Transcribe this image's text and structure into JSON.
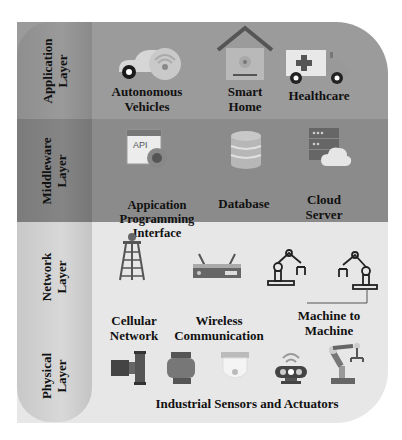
{
  "layers": [
    {
      "label": "Application\nLayer",
      "items": [
        {
          "label": "Autonomous\nVehicles",
          "icon": "autonomous-car-icon"
        },
        {
          "label": "Smart\nHome",
          "icon": "smart-home-icon"
        },
        {
          "label": "Healthcare",
          "icon": "ambulance-icon"
        }
      ]
    },
    {
      "label": "Middleware\nLayer",
      "items": [
        {
          "label": "Appication\nProgramming\nInterface",
          "icon": "api-gear-icon",
          "badge": "API"
        },
        {
          "label": "Database",
          "icon": "database-icon"
        },
        {
          "label": "Cloud\nServer",
          "icon": "cloud-server-icon"
        }
      ]
    },
    {
      "label": "Network\nLayer",
      "items": [
        {
          "label": "Cellular\nNetwork",
          "icon": "cell-tower-icon"
        },
        {
          "label": "Wireless\nCommunication",
          "icon": "router-icon"
        },
        {
          "label": "Machine to\nMachine",
          "icon": "robot-arms-icon"
        }
      ]
    },
    {
      "label": "Physical\nLayer",
      "items": [
        {
          "label": "Industrial Sensors and Actuators",
          "icons": [
            "pump-icon",
            "motor-icon",
            "camera-sensor-icon",
            "wireless-sensor-icon",
            "robot-arm-icon"
          ]
        }
      ]
    }
  ],
  "colors": {
    "application_band": "#9b9b9b",
    "middleware_band": "#8b8b8b",
    "network_physical_band": "#e7e7e7",
    "text": "#111111"
  }
}
